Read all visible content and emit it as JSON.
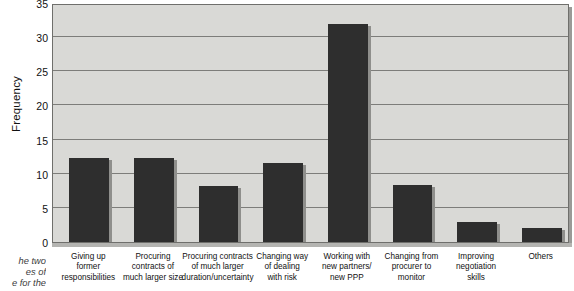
{
  "chart_data": {
    "type": "bar",
    "title": "",
    "xlabel": "",
    "ylabel": "Frequency",
    "ylim": [
      0,
      35
    ],
    "ytick_step": 5,
    "yticks": [
      0,
      5,
      10,
      15,
      20,
      25,
      30,
      35
    ],
    "ytick_labels": [
      "0",
      "5",
      "10",
      "15",
      "20",
      "25",
      "30",
      "35"
    ],
    "grid": true,
    "legend": false,
    "categories": [
      "Giving up former responsibilities",
      "Procuring contracts of much larger size",
      "Procuring contracts of much larger duration/uncertainty",
      "Changing way of dealing with risk",
      "Working with new partners/ new PPP",
      "Changing from procurer to monitor",
      "Improving negotiation skills",
      "Others"
    ],
    "category_lines": [
      [
        "Giving up",
        "former",
        "responsibilities"
      ],
      [
        "Procuring",
        "contracts of",
        "much larger size"
      ],
      [
        "Procuring contracts",
        "of much larger",
        "duration/uncertainty"
      ],
      [
        "Changing way",
        "of dealing",
        "with risk"
      ],
      [
        "Working with",
        "new partners/",
        "new PPP"
      ],
      [
        "Changing from",
        "procurer to",
        "monitor"
      ],
      [
        "Improving",
        "negotiation",
        "skills"
      ],
      [
        "Others"
      ]
    ],
    "values": [
      12.3,
      12.3,
      8.2,
      11.6,
      32,
      8.3,
      3,
      2
    ],
    "bar_color": "#2e2e2e",
    "plot_background": "#d9d9d6",
    "gridline_color": "#7d7d7a"
  },
  "caption": {
    "lines": [
      "he two",
      "es of",
      "e for the"
    ]
  }
}
